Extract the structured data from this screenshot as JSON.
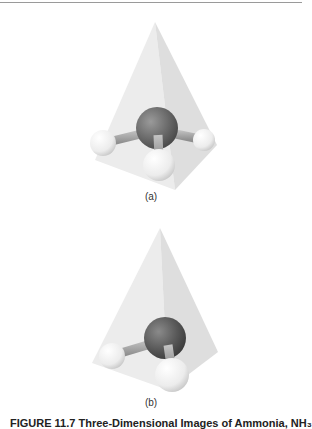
{
  "figure": {
    "caption": "FIGURE 11.7 Three-Dimensional Images of Ammonia, NH₃",
    "panels": [
      {
        "label": "(a)",
        "molecule": "NH3",
        "view": "tetrahedral pyramid, front view"
      },
      {
        "label": "(b)",
        "molecule": "NH3",
        "view": "tetrahedral pyramid, rotated view"
      }
    ]
  },
  "colors": {
    "pyramid_fill": "#e6e6e6",
    "pyramid_shade": "#d6d6d6",
    "nitrogen_atom": "#6e6e6e",
    "hydrogen_atom": "#f4f4f4",
    "bond": "#a8a8a8",
    "rule": "#9a9a9a"
  }
}
